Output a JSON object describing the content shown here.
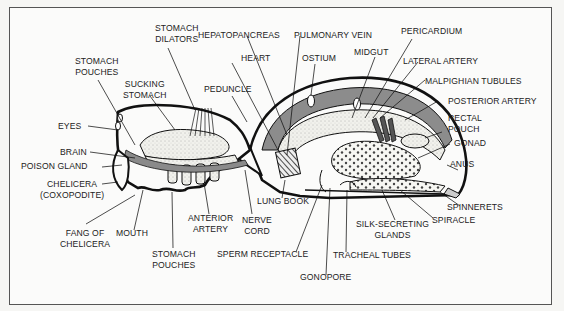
{
  "diagram": {
    "colors": {
      "accent_gray": "#8a8a8a",
      "outline": "#111111",
      "background": "#fbfbfa",
      "stipple": "#e8e8e4"
    },
    "labels": {
      "stomach_dilators": [
        "STOMACH",
        "DILATORS"
      ],
      "hepatopancreas": "HEPATOPANCREAS",
      "pulmonary_vein": "PULMONARY VEIN",
      "pericardium": "PERICARDIUM",
      "stomach_pouches_top": [
        "STOMACH",
        "POUCHES"
      ],
      "sucking_stomach": [
        "SUCKING",
        "STOMACH"
      ],
      "heart": "HEART",
      "ostium": "OSTIUM",
      "midgut": "MIDGUT",
      "lateral_artery": "LATERAL ARTERY",
      "malpighian_tubules": "MALPIGHIAN TUBULES",
      "peduncle": "PEDUNCLE",
      "posterior_artery": "POSTERIOR ARTERY",
      "rectal_pouch": [
        "RECTAL",
        "POUCH"
      ],
      "gonad": "GONAD",
      "anus": "ANUS",
      "eyes": "EYES",
      "brain": "BRAIN",
      "poison_gland": "POISON GLAND",
      "chelicera": [
        "CHELICERA",
        "(COXOPODITE)"
      ],
      "fang_of_chelicera": [
        "FANG OF",
        "CHELICERA"
      ],
      "mouth": "MOUTH",
      "anterior_artery": [
        "ANTERIOR",
        "ARTERY"
      ],
      "nerve_cord": [
        "NERVE",
        "CORD"
      ],
      "lung_book": "LUNG BOOK",
      "stomach_pouches_bottom": [
        "STOMACH",
        "POUCHES"
      ],
      "sperm_receptacle": "SPERM RECEPTACLE",
      "gonopore": "GONOPORE",
      "tracheal_tubes": "TRACHEAL TUBES",
      "silk_secreting_glands": [
        "SILK-SECRETING",
        "GLANDS"
      ],
      "spiracle": "SPIRACLE",
      "spinnerets": "SPINNERETS"
    }
  }
}
